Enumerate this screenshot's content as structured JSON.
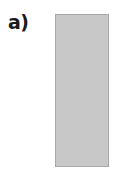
{
  "figure": {
    "panel_label": "a)",
    "shape": {
      "type": "rectangle",
      "fill_color": "#c8c8c8",
      "border_color": "#a8a8a8"
    }
  }
}
